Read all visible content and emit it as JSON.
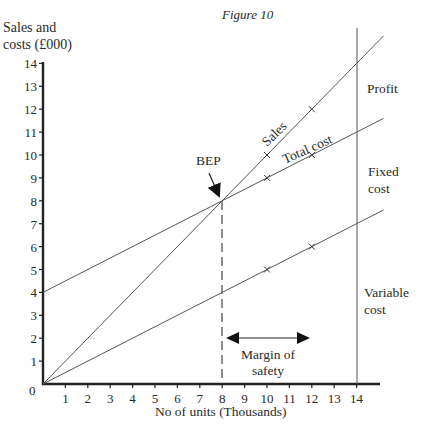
{
  "chart_data": {
    "type": "line",
    "title": "Figure 10",
    "xlabel": "No of units (Thousands)",
    "ylabel": "Sales and costs (£000)",
    "ylabel_lines": [
      "Sales and",
      "costs (£000)"
    ],
    "xlim": [
      0,
      15
    ],
    "ylim": [
      0,
      14
    ],
    "x_ticks": [
      1,
      2,
      3,
      4,
      5,
      6,
      7,
      8,
      9,
      10,
      11,
      12,
      13,
      14
    ],
    "y_ticks": [
      0,
      1,
      2,
      3,
      4,
      5,
      6,
      7,
      8,
      9,
      10,
      11,
      12,
      13,
      14
    ],
    "grid": false,
    "series": [
      {
        "name": "Sales",
        "x": [
          0,
          8,
          10,
          12,
          14,
          15.2
        ],
        "values": [
          0,
          8,
          10,
          12,
          14,
          15.2
        ],
        "markers_at": [
          10,
          12
        ]
      },
      {
        "name": "Total cost",
        "x": [
          0,
          8,
          10,
          12,
          14,
          15.2
        ],
        "values": [
          4,
          8,
          9,
          10,
          11,
          11.6
        ],
        "markers_at": [
          10,
          12
        ]
      },
      {
        "name": "Variable cost",
        "x": [
          0,
          8,
          10,
          12,
          14,
          15.2
        ],
        "values": [
          0,
          4,
          5,
          6,
          7,
          7.6
        ],
        "markers_at": [
          10,
          12
        ]
      }
    ],
    "annotations": [
      {
        "text": "BEP",
        "x": 8,
        "y": 8,
        "type": "arrow-label"
      },
      {
        "text": "Margin of safety",
        "from_x": 8,
        "to_x": 12,
        "type": "double-arrow"
      },
      {
        "text": "Profit",
        "region": "between sales and total cost at x=14"
      },
      {
        "text": "Fixed cost",
        "region": "between total cost and variable cost at x=14"
      },
      {
        "text": "Variable cost",
        "region": "below variable cost at x=14"
      }
    ],
    "reference_lines": [
      {
        "type": "vertical",
        "x": 8,
        "style": "dashed",
        "label": "break-even output"
      },
      {
        "type": "vertical",
        "x": 14,
        "style": "solid",
        "label": "actual output"
      }
    ]
  },
  "labels": {
    "figure_title": "Figure 10",
    "y_axis_line1": "Sales and",
    "y_axis_line2": "costs (£000)",
    "x_axis": "No of units (Thousands)",
    "sales": "Sales",
    "total_cost": "Total cost",
    "bep": "BEP",
    "profit": "Profit",
    "fixed_cost_line1": "Fixed",
    "fixed_cost_line2": "cost",
    "variable_cost_line1": "Variable",
    "variable_cost_line2": "cost",
    "margin_line1": "Margin of",
    "margin_line2": "safety",
    "origin": "0"
  },
  "colors": {
    "axis": "#222222",
    "line": "#555555",
    "text": "#2a2a2a"
  }
}
